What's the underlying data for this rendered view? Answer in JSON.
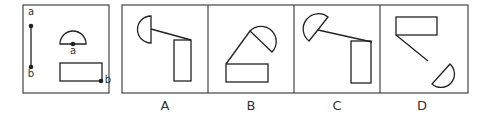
{
  "panels": [
    {
      "id": "reference",
      "labels": {
        "point_a_top": "a",
        "point_b_bottom": "b",
        "semicircle_point": "a",
        "rect_point": "b"
      }
    },
    {
      "id": "A",
      "label": "A"
    },
    {
      "id": "B",
      "label": "B"
    },
    {
      "id": "C",
      "label": "C"
    },
    {
      "id": "D",
      "label": "D"
    }
  ],
  "colors": {
    "stroke": "#333333",
    "background": "#ffffff",
    "border": "#555555"
  }
}
